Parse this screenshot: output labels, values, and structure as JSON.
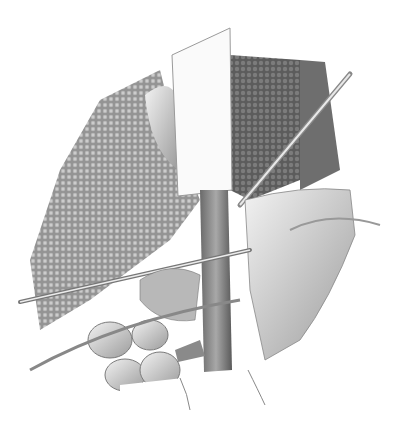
{
  "image": {
    "kind": "grayscale surgical anatomical illustration",
    "width": 408,
    "height": 421,
    "background": "#ffffff",
    "subjects": [
      "retractor blade",
      "liver tissue (granular)",
      "abdominal vessel",
      "surgical instruments",
      "bowel loops",
      "retracted tissue"
    ],
    "palette": {
      "light": "#eeeeee",
      "mid": "#9a9a9a",
      "dark": "#555555",
      "darkest": "#3a3a3a"
    }
  }
}
